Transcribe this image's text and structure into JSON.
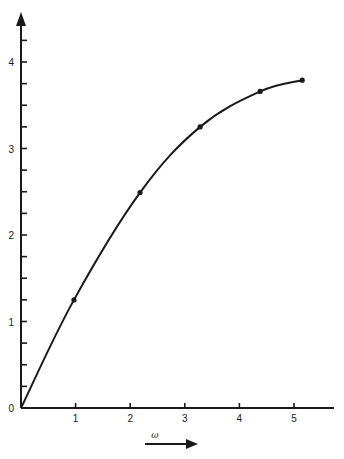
{
  "chart_data": {
    "type": "line",
    "title": "",
    "xlabel": "ω",
    "ylabel": "",
    "x_ticks": [
      0,
      1,
      2,
      3,
      4,
      5
    ],
    "x_tick_labels": [
      "0",
      "1",
      "2",
      "3",
      "4",
      "5"
    ],
    "y_ticks": [
      0,
      1,
      2,
      3,
      4
    ],
    "y_tick_labels": [
      "0",
      "1",
      "2",
      "3",
      "4"
    ],
    "y_minor_tick_step": 0.25,
    "xlim": [
      0,
      5.7
    ],
    "ylim": [
      0,
      4.6
    ],
    "grid": false,
    "legend": null,
    "series": [
      {
        "name": "curve",
        "smooth": true,
        "markers": true,
        "x": [
          0,
          0.97,
          2.18,
          3.28,
          4.38,
          5.15
        ],
        "y": [
          0,
          1.25,
          2.49,
          3.25,
          3.66,
          3.79
        ]
      }
    ],
    "annotations": [
      {
        "text": "ω",
        "type": "axis-direction-arrow",
        "position": "below-x-axis"
      }
    ]
  },
  "colors": {
    "ink": "#1a1a1a",
    "background": "#ffffff"
  }
}
